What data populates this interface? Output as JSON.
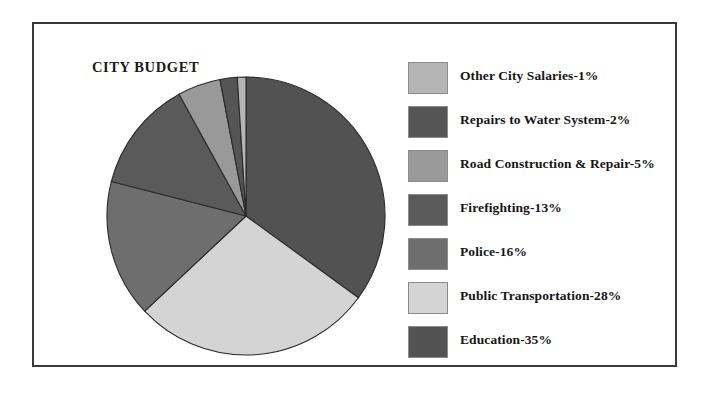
{
  "chart": {
    "title": "CITY BUDGET"
  },
  "chart_data": {
    "type": "pie",
    "title": "CITY BUDGET",
    "xlabel": "",
    "ylabel": "",
    "grid": false,
    "legend_position": "right",
    "units": "percent",
    "total": 100,
    "start_angle_deg": 0,
    "direction": "clockwise",
    "legend_order": "ascending-by-value",
    "slice_draw_order": [
      "Education",
      "Public Transportation",
      "Police",
      "Firefighting",
      "Road Construction & Repair",
      "Repairs to Water System",
      "Other City Salaries"
    ],
    "labels": [
      "Other City Salaries",
      "Repairs to Water System",
      "Road Construction & Repair",
      "Firefighting",
      "Police",
      "Public Transportation",
      "Education"
    ],
    "values": [
      1,
      2,
      5,
      13,
      16,
      28,
      35
    ],
    "colors": [
      "#b5b5b5",
      "#555555",
      "#999999",
      "#5a5a5a",
      "#6e6e6e",
      "#d4d4d4",
      "#525252"
    ],
    "slices": [
      {
        "label": "Other City Salaries",
        "value": 1,
        "display": "Other City Salaries-1%",
        "color": "#b5b5b5"
      },
      {
        "label": "Repairs to Water System",
        "value": 2,
        "display": "Repairs to Water System-2%",
        "color": "#555555"
      },
      {
        "label": "Road Construction & Repair",
        "value": 5,
        "display": "Road Construction & Repair-5%",
        "color": "#999999"
      },
      {
        "label": "Firefighting",
        "value": 13,
        "display": "Firefighting-13%",
        "color": "#5a5a5a"
      },
      {
        "label": "Police",
        "value": 16,
        "display": "Police-16%",
        "color": "#6e6e6e"
      },
      {
        "label": "Public Transportation",
        "value": 28,
        "display": "Public Transportation-28%",
        "color": "#d4d4d4"
      },
      {
        "label": "Education",
        "value": 35,
        "display": "Education-35%",
        "color": "#525252"
      }
    ]
  },
  "legend": {
    "items": [
      {
        "label": "Other City Salaries-1%",
        "color": "#b5b5b5"
      },
      {
        "label": "Repairs to Water System-2%",
        "color": "#555555"
      },
      {
        "label": "Road Construction & Repair-5%",
        "color": "#999999"
      },
      {
        "label": "Firefighting-13%",
        "color": "#5a5a5a"
      },
      {
        "label": "Police-16%",
        "color": "#6e6e6e"
      },
      {
        "label": "Public Transportation-28%",
        "color": "#d4d4d4"
      },
      {
        "label": "Education-35%",
        "color": "#525252"
      }
    ]
  },
  "style": {
    "frame_border": "#3a3a3a",
    "slice_outline": "#2a2a2a",
    "background": "#ffffff"
  }
}
